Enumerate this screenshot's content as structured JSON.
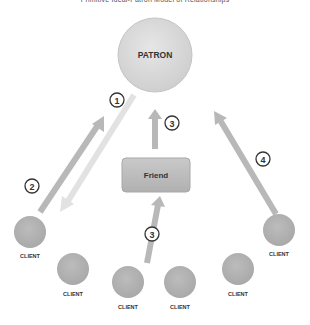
{
  "title": "Primitive Ideal-Patron Model of Relationships",
  "patron": {
    "label": "PATRON"
  },
  "friend": {
    "label": "Friend"
  },
  "clients": [
    {
      "label": "CLIENT"
    },
    {
      "label": "CLIENT"
    },
    {
      "label": "CLIENT"
    },
    {
      "label": "CLIENT"
    },
    {
      "label": "CLIENT"
    },
    {
      "label": "CLIENT"
    }
  ],
  "steps": [
    {
      "number": "1"
    },
    {
      "number": "2"
    },
    {
      "number": "3"
    },
    {
      "number": "3"
    },
    {
      "number": "4"
    }
  ],
  "colors": {
    "patron_fill": "#d8d8d8",
    "client_fill": "#b4b4b4",
    "friend_fill": "#bdbdbd",
    "arrow_dark": "#b8b8b8",
    "arrow_light": "#e2e2e2"
  }
}
